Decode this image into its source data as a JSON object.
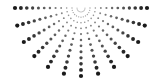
{
  "graphic": {
    "name": "halftone-dot-sunburst",
    "shape": "half-circle radiating downward",
    "center": [
      81,
      8
    ],
    "ray_count": 13,
    "angle_start_deg": 0,
    "angle_end_deg": 180,
    "dots_per_ray": 12,
    "inner_radius": 4,
    "outer_radius_x": 66,
    "outer_radius_y": 68,
    "min_dot_radius": 0.5,
    "max_dot_radius": 2.1,
    "dot_color": "#1a1a1a",
    "background": "#ffffff"
  }
}
